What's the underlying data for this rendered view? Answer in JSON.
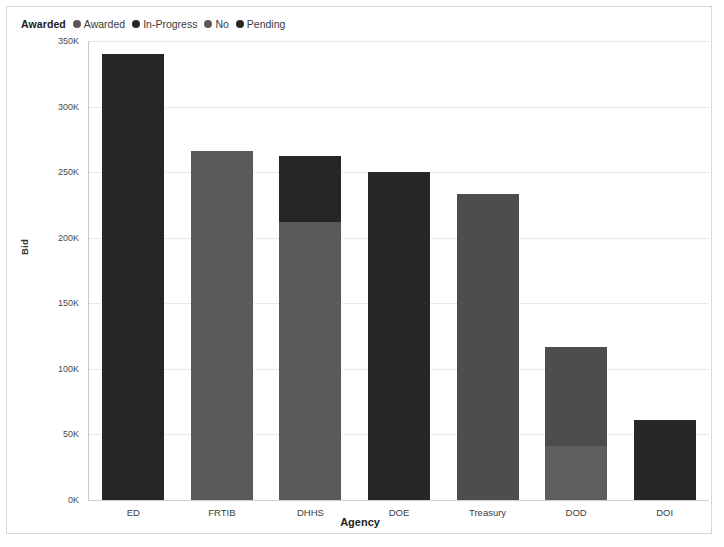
{
  "legend": {
    "title": "Awarded",
    "items": [
      {
        "label": "Awarded",
        "color": "#595959"
      },
      {
        "label": "In-Progress",
        "color": "#262626"
      },
      {
        "label": "No",
        "color": "#595959"
      },
      {
        "label": "Pending",
        "color": "#262626"
      }
    ]
  },
  "chart_data": {
    "type": "bar",
    "stacked": true,
    "title": "",
    "xlabel": "Agency",
    "ylabel": "Bid",
    "categories": [
      "ED",
      "FRTIB",
      "DHHS",
      "DOE",
      "Treasury",
      "DOD",
      "DOI"
    ],
    "ylim": [
      0,
      350000
    ],
    "ytick_values": [
      0,
      50000,
      100000,
      150000,
      200000,
      250000,
      300000,
      350000
    ],
    "ytick_labels": [
      "0K",
      "50K",
      "100K",
      "150K",
      "200K",
      "250K",
      "300K",
      "350K"
    ],
    "grid": true,
    "legend_position": "top-left",
    "series": [
      {
        "name": "In-Progress",
        "color": "#262626",
        "values": [
          340000,
          0,
          50000,
          250000,
          0,
          0,
          61000
        ]
      },
      {
        "name": "Awarded",
        "color": "#595959",
        "values": [
          0,
          266000,
          212000,
          0,
          233000,
          41000,
          0
        ]
      },
      {
        "name": "Pending",
        "color": "#4d4d4d",
        "values": [
          0,
          0,
          0,
          0,
          0,
          76000,
          0
        ]
      }
    ],
    "totals": [
      340000,
      266000,
      262000,
      250000,
      233000,
      117000,
      61000
    ],
    "bars": [
      {
        "category": "ED",
        "total": 340000,
        "segments": [
          {
            "series": "In-Progress",
            "value": 340000,
            "color": "#262626"
          }
        ]
      },
      {
        "category": "FRTIB",
        "total": 266000,
        "segments": [
          {
            "series": "Awarded",
            "value": 266000,
            "color": "#595959"
          }
        ]
      },
      {
        "category": "DHHS",
        "total": 262000,
        "segments": [
          {
            "series": "In-Progress",
            "value": 50000,
            "color": "#262626"
          },
          {
            "series": "Awarded",
            "value": 212000,
            "color": "#595959"
          }
        ]
      },
      {
        "category": "DOE",
        "total": 250000,
        "segments": [
          {
            "series": "In-Progress",
            "value": 250000,
            "color": "#262626"
          }
        ]
      },
      {
        "category": "Treasury",
        "total": 233000,
        "segments": [
          {
            "series": "Awarded",
            "value": 233000,
            "color": "#4d4d4d"
          }
        ]
      },
      {
        "category": "DOD",
        "total": 117000,
        "segments": [
          {
            "series": "Pending",
            "value": 76000,
            "color": "#4d4d4d"
          },
          {
            "series": "Awarded",
            "value": 41000,
            "color": "#5e5e5e"
          }
        ]
      },
      {
        "category": "DOI",
        "total": 61000,
        "segments": [
          {
            "series": "In-Progress",
            "value": 61000,
            "color": "#262626"
          }
        ]
      }
    ]
  }
}
